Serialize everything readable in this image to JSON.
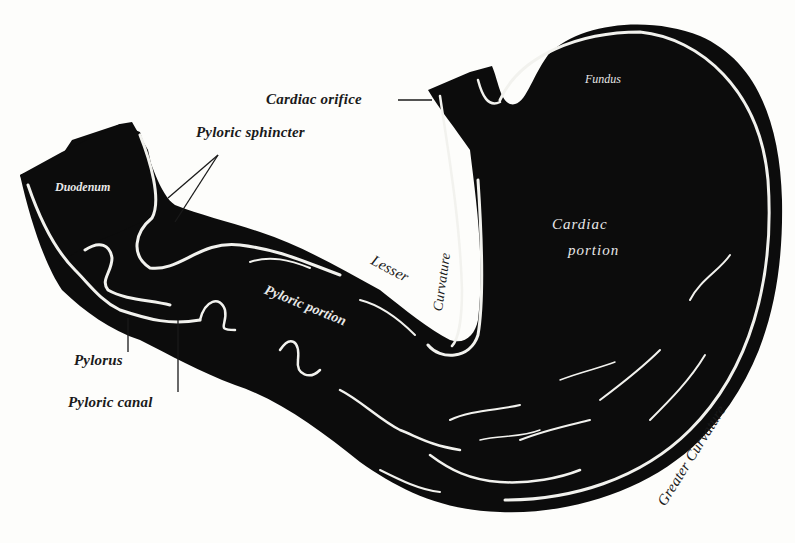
{
  "figure": {
    "colors": {
      "background": "#fdfdfb",
      "ink": "#0c0c0c",
      "mucosa_line": "#f2f2ee"
    }
  },
  "labels": {
    "cardiac_orifice": "Cardiac orifice",
    "pyloric_sphincter": "Pyloric sphincter",
    "duodenum": "Duodenum",
    "fundus": "Fundus",
    "cardiac_portion_line1": "Cardiac",
    "cardiac_portion_line2": "portion",
    "lesser": "Lesser",
    "curvature_lesser": "Curvature",
    "pyloric_portion": "Pyloric portion",
    "pylorus": "Pylorus",
    "pyloric_canal": "Pyloric canal",
    "greater_curvature": "Greater Curvature"
  }
}
